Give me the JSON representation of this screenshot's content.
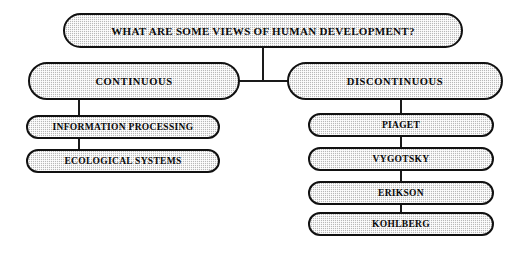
{
  "diagram": {
    "title_text": "WHAT ARE SOME VIEWS OF HUMAN DEVELOPMENT?",
    "root": {
      "label": "WHAT ARE SOME VIEWS OF HUMAN DEVELOPMENT?"
    },
    "branches": [
      {
        "id": "continuous",
        "label": "CONTINUOUS",
        "children": [
          {
            "id": "information-processing",
            "label": "INFORMATION PROCESSING"
          },
          {
            "id": "ecological-systems",
            "label": "ECOLOGICAL SYSTEMS"
          }
        ]
      },
      {
        "id": "discontinuous",
        "label": "DISCONTINUOUS",
        "children": [
          {
            "id": "piaget",
            "label": "PIAGET"
          },
          {
            "id": "vygotsky",
            "label": "VYGOTSKY"
          },
          {
            "id": "erikson",
            "label": "ERIKSON"
          },
          {
            "id": "kohlberg",
            "label": "KOHLBERG"
          }
        ]
      }
    ],
    "colors": {
      "background": "#ffffff",
      "node_fill": "#d8d8d8",
      "node_border": "#111111",
      "connector": "#1a1a1a",
      "text": "#0a0a0a"
    }
  }
}
